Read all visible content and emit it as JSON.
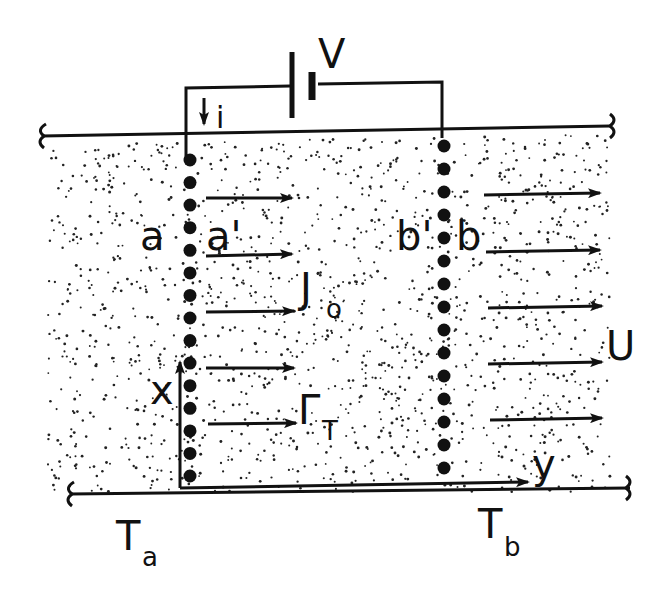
{
  "colors": {
    "ink": "#111111",
    "background": "#ffffff"
  },
  "circuit": {
    "battery_label": "V",
    "current_label": "i"
  },
  "electrodes": {
    "left_outer": "a",
    "left_inner": "a'",
    "right_inner": "b'",
    "right_outer": "b"
  },
  "fluxes": {
    "current_density": {
      "main": "J",
      "sub": "o"
    },
    "heat_flux": {
      "main": "Γ",
      "sub": "T"
    },
    "flow_velocity": "U"
  },
  "axes": {
    "x": "x",
    "y": "y"
  },
  "temperatures": {
    "left": {
      "main": "T",
      "sub": "a"
    },
    "right": {
      "main": "T",
      "sub": "b"
    }
  }
}
